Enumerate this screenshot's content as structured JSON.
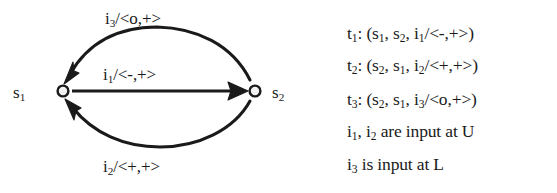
{
  "figure": {
    "type": "state-transition-diagram",
    "ink_color": "#1a1a1a",
    "background_color": "#ffffff"
  },
  "graph": {
    "nodes": [
      {
        "id": "s1",
        "label_html": "s",
        "label_sub": "1",
        "cx": 63,
        "cy": 91
      },
      {
        "id": "s2",
        "label_html": "s",
        "label_sub": "2",
        "cx": 255,
        "cy": 91
      }
    ],
    "edges": [
      {
        "id": "t3",
        "from": "s2",
        "to": "s1",
        "shape": "arc-above",
        "label_input": "i",
        "label_input_sub": "3",
        "label_output": "/<o,+>"
      },
      {
        "id": "t1",
        "from": "s1",
        "to": "s2",
        "shape": "straight",
        "label_input": "i",
        "label_input_sub": "1",
        "label_output": "/<-,+>"
      },
      {
        "id": "t2",
        "from": "s2",
        "to": "s1",
        "shape": "arc-below",
        "label_input": "i",
        "label_input_sub": "2",
        "label_output": "/<+,+>"
      }
    ]
  },
  "transitions": {
    "lines": [
      {
        "name": "t",
        "name_sub": "1",
        "text_after": ": (s",
        "arg1_sub": "1",
        "mid": ", s",
        "arg2_sub": "2",
        "mid2": ", i",
        "arg3_sub": "1",
        "tail": "/<-,+>)"
      },
      {
        "name": "t",
        "name_sub": "2",
        "text_after": ": (s",
        "arg1_sub": "2",
        "mid": ", s",
        "arg2_sub": "1",
        "mid2": ", i",
        "arg3_sub": "2",
        "tail": "/<+,+>)"
      },
      {
        "name": "t",
        "name_sub": "3",
        "text_after": ": (s",
        "arg1_sub": "2",
        "mid": ", s",
        "arg2_sub": "1",
        "mid2": ", i",
        "arg3_sub": "3",
        "tail": "/<o,+>)"
      }
    ],
    "notes": [
      {
        "lead": "i",
        "lead_sub": "1",
        "mid": ", i",
        "mid_sub": "2",
        "tail": " are input at U"
      },
      {
        "lead": "i",
        "lead_sub": "3",
        "mid": "",
        "mid_sub": "",
        "tail": " is input at L"
      }
    ]
  }
}
